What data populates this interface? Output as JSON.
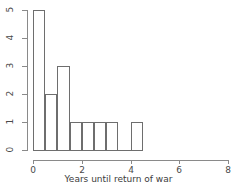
{
  "chart_data": {
    "type": "bar",
    "title": "",
    "subtitle": "",
    "xlabel": "Years until return of war",
    "ylabel": "",
    "bin_width": 0.5,
    "categories": [
      "0-0.5",
      "0.5-1",
      "1-1.5",
      "1.5-2",
      "2-2.5",
      "2.5-3",
      "3-3.5",
      "3.5-4",
      "4-4.5"
    ],
    "bin_starts": [
      0,
      0.5,
      1,
      1.5,
      2,
      2.5,
      3,
      3.5,
      4
    ],
    "bin_ends": [
      0.5,
      1,
      1.5,
      2,
      2.5,
      3,
      3.5,
      4,
      4.5
    ],
    "values": [
      5,
      2,
      3,
      1,
      1,
      1,
      1,
      0,
      1
    ],
    "xlim": [
      0,
      8
    ],
    "ylim": [
      0,
      5
    ],
    "xticks": [
      0,
      2,
      4,
      6,
      8
    ],
    "xtick_labels": [
      "0",
      "2",
      "4",
      "6",
      "8"
    ],
    "yticks": [
      0,
      1,
      2,
      3,
      4,
      5
    ],
    "ytick_labels": [
      "0",
      "1",
      "2",
      "3",
      "4",
      "5"
    ],
    "grid": false,
    "legend": null,
    "bar_edge_color": "#6e6e6e",
    "bar_fill_color": "#ffffff",
    "axis_color": "#8a8a8a",
    "text_color": "#4a4a4a"
  }
}
